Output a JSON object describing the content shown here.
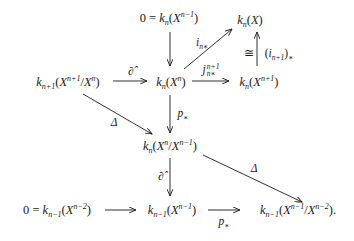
{
  "diagram": {
    "type": "commutative-diagram",
    "nodes": {
      "top_zero": {
        "lhs": "0",
        "eq": "=",
        "k": "k",
        "k_sub": "n",
        "X": "X",
        "X_sup": "n−1"
      },
      "top_right": {
        "k": "k",
        "k_sub": "n",
        "X": "X"
      },
      "mid_left": {
        "k": "k",
        "k_sub": "n+1",
        "X1": "X",
        "X1_sup": "n+1",
        "slash": "/",
        "X2": "X",
        "X2_sup": "n"
      },
      "mid_center": {
        "k": "k",
        "k_sub": "n",
        "X": "X",
        "X_sup": "n"
      },
      "mid_right": {
        "k": "k",
        "k_sub": "n",
        "X": "X",
        "X_sup": "n+1"
      },
      "quotient": {
        "k": "k",
        "k_sub": "n",
        "X1": "X",
        "X1_sup": "n",
        "slash": "/",
        "X2": "X",
        "X2_sup": "n−1"
      },
      "bot_left": {
        "lhs": "0",
        "eq": "=",
        "k": "k",
        "k_sub": "n−1",
        "X": "X",
        "X_sup": "n−2"
      },
      "bot_center": {
        "k": "k",
        "k_sub": "n−1",
        "X": "X",
        "X_sup": "n−1"
      },
      "bot_right": {
        "k": "k",
        "k_sub": "n−1",
        "X1": "X",
        "X1_sup": "n−1",
        "slash": "/",
        "X2": "X",
        "X2_sup": "n−2",
        "end": "."
      }
    },
    "labels": {
      "i_n_star": {
        "base": "i",
        "sub": "n∗"
      },
      "iso": "≅",
      "i_n1_star": {
        "open": "(",
        "base": "i",
        "sub": "n+1",
        "close": ")",
        "star": "∗"
      },
      "partial_hat_top": "∂̂",
      "j": {
        "base": "j",
        "sup": "n+1",
        "sub": "n∗"
      },
      "p_star_vert": {
        "base": "p",
        "sub": "∗"
      },
      "delta_left": "Δ",
      "partial_hat_vert": "∂̂",
      "delta_right": "Δ",
      "p_star_bottom": {
        "base": "p",
        "sub": "∗"
      }
    },
    "arrows": [
      {
        "from": "top_zero",
        "to": "mid_center",
        "label": ""
      },
      {
        "from": "mid_center",
        "to": "top_right",
        "label": "i_n_star"
      },
      {
        "from": "mid_right",
        "to": "top_right",
        "label": "i_n1_star",
        "iso": true
      },
      {
        "from": "mid_left",
        "to": "mid_center",
        "label": "partial_hat_top"
      },
      {
        "from": "mid_center",
        "to": "mid_right",
        "label": "j"
      },
      {
        "from": "mid_center",
        "to": "quotient",
        "label": "p_star_vert"
      },
      {
        "from": "mid_left",
        "to": "quotient",
        "label": "delta_left"
      },
      {
        "from": "quotient",
        "to": "bot_center",
        "label": "partial_hat_vert"
      },
      {
        "from": "quotient",
        "to": "bot_right",
        "label": "delta_right"
      },
      {
        "from": "bot_left",
        "to": "bot_center",
        "label": ""
      },
      {
        "from": "bot_center",
        "to": "bot_right",
        "label": "p_star_bottom"
      }
    ]
  }
}
